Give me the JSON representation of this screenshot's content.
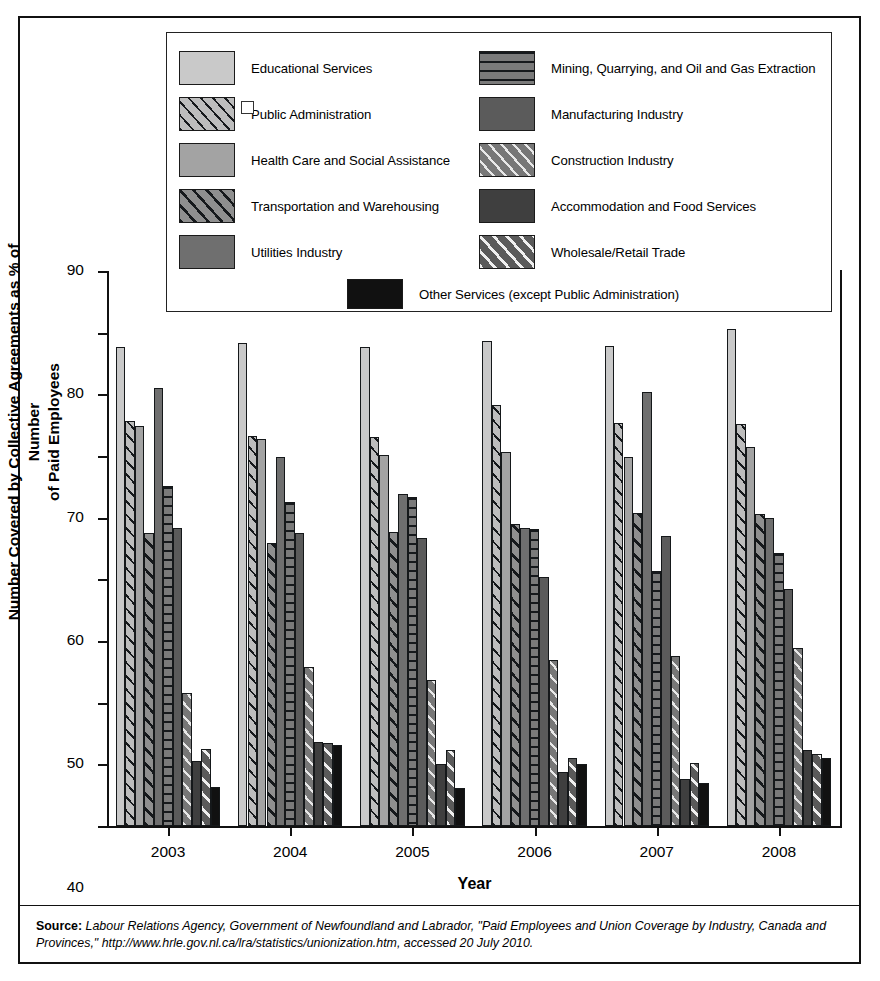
{
  "chart_data": {
    "type": "bar",
    "title": "",
    "xlabel": "Year",
    "ylabel": "Number Covered by Collective Agreements as % of Number of Paid Employees",
    "ylabel_lines": [
      "Number Covered by Collective Agreements as % of Number",
      "of Paid Employees"
    ],
    "categories": [
      "2003",
      "2004",
      "2005",
      "2006",
      "2007",
      "2008"
    ],
    "ylim": [
      0,
      90
    ],
    "yticks": [
      0,
      10,
      20,
      30,
      40,
      50,
      60,
      70,
      80,
      90
    ],
    "grid": false,
    "legend_position": "top",
    "series": [
      {
        "name": "Educational Services",
        "pattern": "solid",
        "color": "#c9c9c9",
        "values": [
          77.7,
          78.3,
          77.6,
          78.6,
          77.9,
          80.6
        ]
      },
      {
        "name": "Public Administration",
        "pattern": "diagonal-wide",
        "color": "#bdbdbd",
        "values": [
          65.6,
          63.2,
          63.1,
          68.2,
          65.4,
          65.2
        ]
      },
      {
        "name": "Health Care and Social Assistance",
        "pattern": "solid",
        "color": "#a3a3a3",
        "values": [
          64.8,
          62.8,
          60.1,
          60.6,
          59.9,
          61.5
        ]
      },
      {
        "name": "Transportation and Warehousing",
        "pattern": "diagonal-dark",
        "color": "#8f8f8f",
        "values": [
          47.5,
          45.9,
          47.6,
          48.9,
          50.8,
          50.6
        ]
      },
      {
        "name": "Utilities Industry",
        "pattern": "solid",
        "color": "#6f6f6f",
        "values": [
          71.0,
          59.8,
          53.9,
          48.3,
          70.4,
          50.0
        ]
      },
      {
        "name": "Mining, Quarrying, and Oil and Gas Extraction",
        "pattern": "horizontal",
        "color": "#7a7a7a",
        "values": [
          55.2,
          52.5,
          53.4,
          48.2,
          41.4,
          44.3
        ]
      },
      {
        "name": "Manufacturing Industry",
        "pattern": "solid-dark",
        "color": "#5b5b5b",
        "values": [
          48.3,
          47.5,
          46.7,
          40.3,
          47.0,
          38.5
        ]
      },
      {
        "name": "Construction Industry",
        "pattern": "diagonal-light",
        "color": "#777777",
        "values": [
          21.5,
          25.8,
          23.7,
          26.9,
          27.6,
          28.8
        ]
      },
      {
        "name": "Accommodation and Food Services",
        "pattern": "solid-darker",
        "color": "#3f3f3f",
        "values": [
          10.6,
          13.6,
          10.0,
          8.7,
          7.7,
          12.4
        ]
      },
      {
        "name": "Wholesale/Retail Trade",
        "pattern": "diagonal-bold",
        "color": "#5a5a5a",
        "values": [
          12.5,
          13.4,
          12.4,
          11.1,
          10.2,
          11.6
        ]
      },
      {
        "name": "Other Services (except Public Administration)",
        "pattern": "black",
        "color": "#111111",
        "values": [
          6.4,
          13.2,
          6.1,
          10.0,
          6.9,
          11.1
        ]
      }
    ]
  },
  "legend": {
    "left_column": [
      "Educational Services",
      "Public Administration",
      "Health Care and Social Assistance",
      "Transportation and Warehousing",
      "Utilities Industry"
    ],
    "right_column": [
      "Mining, Quarrying, and Oil and Gas Extraction",
      "Manufacturing Industry",
      "Construction Industry",
      "Accommodation and Food Services",
      "Wholesale/Retail Trade"
    ],
    "bottom": "Other Services (except Public Administration)"
  },
  "source": {
    "label": "Source:",
    "text": " Labour Relations Agency, Government of Newfoundland and Labrador, \"Paid Employees and Union Coverage by Industry, Canada and Provinces,\" http://www.hrle.gov.nl.ca/lra/statistics/unionization.htm, accessed 20 July 2010."
  }
}
